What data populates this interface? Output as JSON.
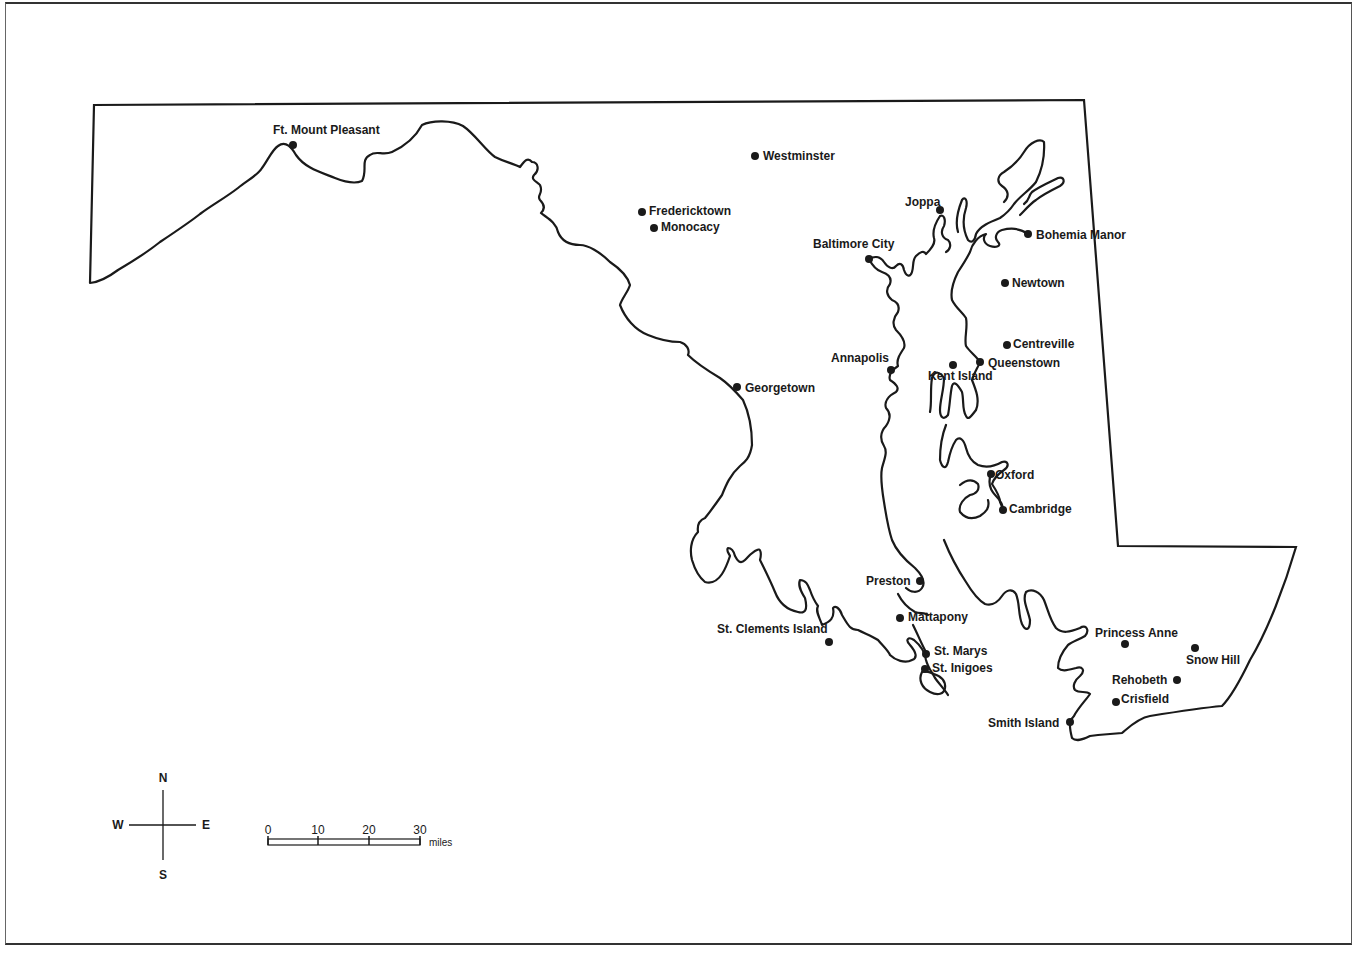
{
  "map": {
    "region": "Maryland",
    "line_color": "#1a1a1a",
    "background": "#ffffff",
    "places": [
      {
        "name": "Ft. Mount Pleasant",
        "x": 293,
        "y": 145,
        "lx": 273,
        "ly": 134,
        "anchor": "start"
      },
      {
        "name": "Westminster",
        "x": 755,
        "y": 156,
        "lx": 763,
        "ly": 160,
        "anchor": "start"
      },
      {
        "name": "Fredericktown",
        "x": 642,
        "y": 212,
        "lx": 649,
        "ly": 215,
        "anchor": "start"
      },
      {
        "name": "Monocacy",
        "x": 654,
        "y": 228,
        "lx": 661,
        "ly": 231,
        "anchor": "start"
      },
      {
        "name": "Joppa",
        "x": 940,
        "y": 210,
        "lx": 905,
        "ly": 206,
        "anchor": "start"
      },
      {
        "name": "Baltimore City",
        "x": 869,
        "y": 259,
        "lx": 813,
        "ly": 248,
        "anchor": "start"
      },
      {
        "name": "Bohemia Manor",
        "x": 1028,
        "y": 234,
        "lx": 1036,
        "ly": 239,
        "anchor": "start"
      },
      {
        "name": "Newtown",
        "x": 1005,
        "y": 283,
        "lx": 1012,
        "ly": 287,
        "anchor": "start"
      },
      {
        "name": "Centreville",
        "x": 1007,
        "y": 345,
        "lx": 1013,
        "ly": 348,
        "anchor": "start"
      },
      {
        "name": "Annapolis",
        "x": 891,
        "y": 370,
        "lx": 831,
        "ly": 362,
        "anchor": "start"
      },
      {
        "name": "Queenstown",
        "x": 980,
        "y": 362,
        "lx": 988,
        "ly": 367,
        "anchor": "start"
      },
      {
        "name": "Kent Island",
        "x": 953,
        "y": 365,
        "lx": 928,
        "ly": 380,
        "anchor": "start"
      },
      {
        "name": "Georgetown",
        "x": 737,
        "y": 387,
        "lx": 745,
        "ly": 392,
        "anchor": "start"
      },
      {
        "name": "Oxford",
        "x": 991,
        "y": 474,
        "lx": 995,
        "ly": 479,
        "anchor": "start"
      },
      {
        "name": "Cambridge",
        "x": 1003,
        "y": 510,
        "lx": 1009,
        "ly": 513,
        "anchor": "start"
      },
      {
        "name": "Preston",
        "x": 920,
        "y": 581,
        "lx": 866,
        "ly": 585,
        "anchor": "start"
      },
      {
        "name": "Mattapony",
        "x": 900,
        "y": 618,
        "lx": 908,
        "ly": 621,
        "anchor": "start"
      },
      {
        "name": "St. Clements Island",
        "x": 829,
        "y": 642,
        "lx": 717,
        "ly": 633,
        "anchor": "start"
      },
      {
        "name": "St. Marys",
        "x": 926,
        "y": 654,
        "lx": 934,
        "ly": 655,
        "anchor": "start"
      },
      {
        "name": "St. Inigoes",
        "x": 925,
        "y": 669,
        "lx": 932,
        "ly": 672,
        "anchor": "start"
      },
      {
        "name": "Princess Anne",
        "x": 1125,
        "y": 644,
        "lx": 1095,
        "ly": 637,
        "anchor": "start"
      },
      {
        "name": "Snow Hill",
        "x": 1195,
        "y": 648,
        "lx": 1186,
        "ly": 664,
        "anchor": "start"
      },
      {
        "name": "Rehobeth",
        "x": 1177,
        "y": 680,
        "lx": 1112,
        "ly": 684,
        "anchor": "start"
      },
      {
        "name": "Crisfield",
        "x": 1116,
        "y": 702,
        "lx": 1121,
        "ly": 703,
        "anchor": "start"
      },
      {
        "name": "Smith Island",
        "x": 1070,
        "y": 722,
        "lx": 988,
        "ly": 727,
        "anchor": "start"
      }
    ]
  },
  "compass": {
    "north": "N",
    "south": "S",
    "east": "E",
    "west": "W"
  },
  "scale_bar": {
    "ticks": [
      "0",
      "10",
      "20",
      "30"
    ],
    "unit": "miles"
  }
}
